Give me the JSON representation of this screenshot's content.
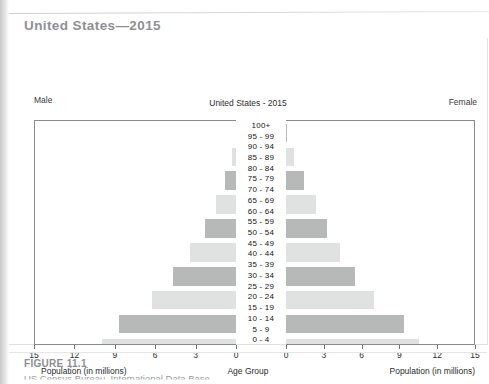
{
  "header": {
    "chapter_title": "United States—2015"
  },
  "figure": {
    "number": "FIGURE 11.1",
    "source": "US Census Bureau, International Data Base"
  },
  "labels": {
    "male": "Male",
    "female": "Female",
    "axis_title_left": "Population (in millions)",
    "axis_title_right": "Population (in millions)",
    "axis_title_center": "Age Group"
  },
  "chart_data": {
    "type": "bar",
    "subtype": "population-pyramid",
    "title": "United States - 2015",
    "xlabel": "Population (in millions)",
    "ylabel": "Age Group",
    "xlim_left": [
      15,
      0
    ],
    "xlim_right": [
      0,
      15
    ],
    "grid": false,
    "legend": [
      "Male",
      "Female"
    ],
    "legend_position": "top-outside",
    "ticks_left": [
      "15",
      "12",
      "9",
      "6",
      "3",
      "0"
    ],
    "ticks_right": [
      "0",
      "3",
      "6",
      "9",
      "12",
      "15"
    ],
    "tick_values": [
      0,
      3,
      6,
      9,
      12,
      15
    ],
    "categories": [
      "100+",
      "95 - 99",
      "90 - 94",
      "85 - 89",
      "80 - 84",
      "75 - 79",
      "70 - 74",
      "65 - 69",
      "60 - 64",
      "55 - 59",
      "50 - 54",
      "45 - 49",
      "40 - 44",
      "35 - 39",
      "30 - 34",
      "25 - 29",
      "20 - 24",
      "15 - 19",
      "10 - 14",
      "5 - 9",
      "0 - 4"
    ],
    "series": [
      {
        "name": "Male",
        "values": [
          0.01,
          0.3,
          0.8,
          1.5,
          2.3,
          3.4,
          4.7,
          6.3,
          8.7,
          10.0,
          10.4,
          10.1,
          9.9,
          10.2,
          10.8,
          10.9,
          11.4,
          10.6,
          10.5,
          10.3,
          10.1
        ]
      },
      {
        "name": "Female",
        "values": [
          0.04,
          0.6,
          1.4,
          2.4,
          3.3,
          4.3,
          5.5,
          7.0,
          9.4,
          10.6,
          10.9,
          10.4,
          10.1,
          10.3,
          10.8,
          10.6,
          10.9,
          10.1,
          10.0,
          9.9,
          9.7
        ]
      }
    ],
    "bar_shading": [
      "dark",
      "light",
      "dark",
      "light",
      "dark",
      "light",
      "dark",
      "light",
      "dark",
      "light",
      "dark",
      "light",
      "dark",
      "light",
      "dark",
      "light",
      "dark",
      "light",
      "dark",
      "light",
      "dark"
    ]
  }
}
